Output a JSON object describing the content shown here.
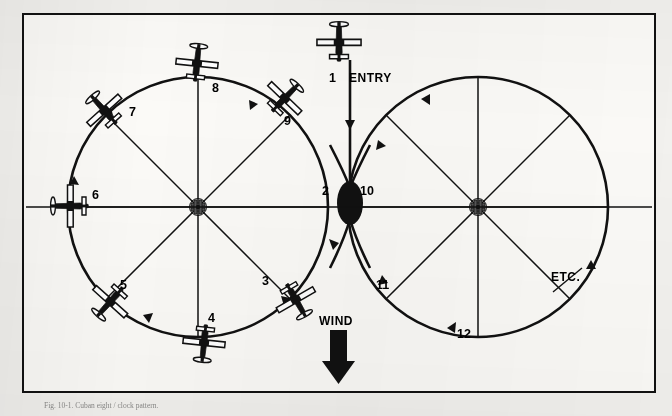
{
  "figure": {
    "title_caption": "Fig. 10-1. Cuban eight / clock pattern.",
    "frame_color": "#111111",
    "background_color": "#fbfaf7",
    "ink_color": "#000000"
  },
  "labels": {
    "entry": "ENTRY",
    "wind": "WIND",
    "etc": "ETC."
  },
  "positions": [
    {
      "n": "1",
      "x": 333,
      "y": 78,
      "circle": "left",
      "note": "entry top"
    },
    {
      "n": "2",
      "x": 326,
      "y": 191,
      "circle": "left",
      "note": "crossover left side"
    },
    {
      "n": "3",
      "x": 266,
      "y": 281,
      "circle": "left",
      "note": "lower right"
    },
    {
      "n": "4",
      "x": 212,
      "y": 318,
      "circle": "left",
      "note": "bottom"
    },
    {
      "n": "5",
      "x": 124,
      "y": 285,
      "circle": "left",
      "note": "lower left"
    },
    {
      "n": "6",
      "x": 96,
      "y": 195,
      "circle": "left",
      "note": "left / 9 o'clock"
    },
    {
      "n": "7",
      "x": 133,
      "y": 112,
      "circle": "left",
      "note": "upper left"
    },
    {
      "n": "8",
      "x": 216,
      "y": 88,
      "circle": "left",
      "note": "top"
    },
    {
      "n": "9",
      "x": 288,
      "y": 121,
      "circle": "left",
      "note": "upper right"
    },
    {
      "n": "10",
      "x": 364,
      "y": 191,
      "circle": "right",
      "note": "crossover right side"
    },
    {
      "n": "11",
      "x": 380,
      "y": 285,
      "circle": "right",
      "note": "lower left of right circle"
    },
    {
      "n": "12",
      "x": 461,
      "y": 334,
      "circle": "right",
      "note": "bottom of right circle"
    }
  ],
  "geometry": {
    "left_circle": {
      "cx": 198,
      "cy": 207,
      "r": 130
    },
    "right_circle": {
      "cx": 478,
      "cy": 207,
      "r": 130
    },
    "crossover": {
      "cx": 350,
      "cy": 203,
      "rx": 13,
      "ry": 22
    },
    "spokes_per_circle": 8
  },
  "wind_arrow": {
    "x": 338,
    "y_top": 330,
    "y_bottom": 382,
    "direction": "down"
  },
  "airplanes": [
    {
      "id": "entry-plane",
      "x": 339,
      "y": 42,
      "rot": 0,
      "scale": 1.05
    },
    {
      "id": "plane-3",
      "x": 296,
      "y": 300,
      "rot": 150,
      "scale": 1.0
    },
    {
      "id": "plane-4",
      "x": 204,
      "y": 343,
      "rot": 186,
      "scale": 1.0
    },
    {
      "id": "plane-5",
      "x": 110,
      "y": 302,
      "rot": 222,
      "scale": 1.0
    },
    {
      "id": "plane-6",
      "x": 70,
      "y": 206,
      "rot": 270,
      "scale": 1.0
    },
    {
      "id": "plane-7",
      "x": 104,
      "y": 110,
      "rot": 318,
      "scale": 1.0
    },
    {
      "id": "plane-8",
      "x": 197,
      "y": 63,
      "rot": 6,
      "scale": 1.0
    },
    {
      "id": "plane-9",
      "x": 285,
      "y": 98,
      "rot": 44,
      "scale": 1.0
    }
  ]
}
